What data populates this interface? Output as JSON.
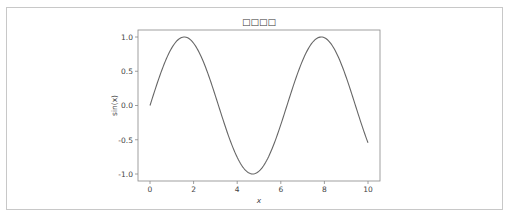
{
  "chart_data": {
    "type": "line",
    "title": "□□□□",
    "xlabel": "x",
    "ylabel": "sin(x)",
    "xlim": [
      -0.5,
      10.5
    ],
    "ylim": [
      -1.1,
      1.1
    ],
    "xticks": [
      0,
      2,
      4,
      6,
      8,
      10
    ],
    "xtick_labels": [
      "0",
      "2",
      "4",
      "6",
      "8",
      "10"
    ],
    "yticks": [
      1.0,
      0.5,
      0.0,
      -0.5,
      -1.0
    ],
    "ytick_labels": [
      "1.0",
      "0.5",
      "0.0",
      "-0.5",
      "-1.0"
    ],
    "grid": false,
    "legend": null,
    "series": [
      {
        "name": "sin(x)",
        "color": "#666666",
        "function": "sin(x)",
        "x_range": [
          0,
          10
        ],
        "x": [
          0,
          0.5,
          1,
          1.5,
          2,
          2.5,
          3,
          3.5,
          4,
          4.5,
          5,
          5.5,
          6,
          6.5,
          7,
          7.5,
          8,
          8.5,
          9,
          9.5,
          10
        ],
        "y": [
          0.0,
          0.479,
          0.841,
          0.997,
          0.909,
          0.598,
          0.141,
          -0.351,
          -0.757,
          -0.978,
          -0.959,
          -0.706,
          -0.279,
          0.215,
          0.657,
          0.938,
          0.989,
          0.798,
          0.412,
          -0.075,
          -0.544
        ]
      }
    ]
  }
}
